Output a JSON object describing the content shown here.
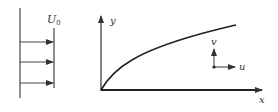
{
  "diagram": {
    "left_panel": {
      "freestream_label": "U",
      "freestream_subscript": "0",
      "arrow_count": 3
    },
    "right_panel": {
      "axis_x_label": "x",
      "axis_y_label": "y",
      "velocity_u_label": "u",
      "velocity_v_label": "v",
      "curve": "boundary-layer-thickness"
    },
    "colors": {
      "stroke": "#333333",
      "background": "#ffffff"
    }
  }
}
